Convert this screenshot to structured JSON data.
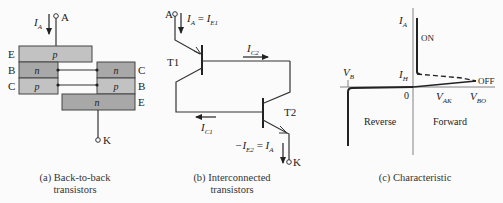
{
  "panel_a": {
    "caption_line1": "(a) Back-to-back",
    "caption_line2": "transistors",
    "terminal_anode": "A",
    "terminal_cathode": "K",
    "current_label": "I",
    "current_sub": "A",
    "left_transistor": [
      {
        "terminal": "E",
        "layer": "p"
      },
      {
        "terminal": "B",
        "layer": "n"
      },
      {
        "terminal": "C",
        "layer": "p"
      }
    ],
    "right_transistor": [
      {
        "terminal": "C",
        "layer": "n"
      },
      {
        "terminal": "B",
        "layer": "p"
      },
      {
        "terminal": "E",
        "layer": "n"
      }
    ],
    "colors": {
      "p_layer": "#c2c2c2",
      "n_layer": "#a8a8a8"
    }
  },
  "panel_b": {
    "caption_line1": "(b) Interconnected",
    "caption_line2": "transistors",
    "terminal_anode": "A",
    "terminal_cathode": "K",
    "t1": "T1",
    "t2": "T2",
    "ia_eq": {
      "lhs": "I",
      "lhs_sub": "A",
      "eq": " = ",
      "rhs": "I",
      "rhs_sub": "E1"
    },
    "ic2": {
      "main": "I",
      "sub": "C2"
    },
    "ic1": {
      "main": "I",
      "sub": "C1"
    },
    "ie2_eq": {
      "lhs": "−I",
      "lhs_sub": "E2",
      "eq": " = ",
      "rhs": "I",
      "rhs_sub": "A"
    }
  },
  "panel_c": {
    "caption": "(c) Characteristic",
    "y_axis": {
      "main": "I",
      "sub": "A"
    },
    "x_axis": {
      "main": "V",
      "sub": "AK"
    },
    "origin": "0",
    "vb": {
      "main": "V",
      "sub": "B"
    },
    "vbo": {
      "main": "V",
      "sub": "BO"
    },
    "ih": {
      "main": "I",
      "sub": "H"
    },
    "on_label": "ON",
    "off_label": "OFF",
    "reverse_label": "Reverse",
    "forward_label": "Forward"
  }
}
